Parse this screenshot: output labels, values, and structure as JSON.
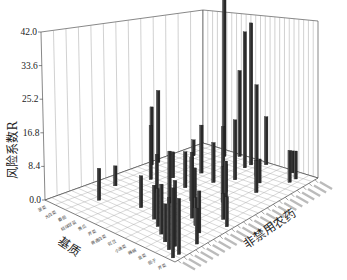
{
  "chart_data": {
    "type": "bar3d",
    "title": "",
    "ylabel": "风险系数R",
    "xlabel": "基质",
    "zlabel": "非禁用农药",
    "ylim": [
      0,
      42.0
    ],
    "y_ticks": [
      "0.0",
      "8.4",
      "16.8",
      "25.2",
      "33.6",
      "42.0"
    ],
    "grid": true,
    "matrix_categories": [
      "菠菜",
      "大白菜",
      "番茄",
      "结球甘蓝",
      "黄瓜",
      "芹菜",
      "普通白菜",
      "豇豆",
      "小油菜",
      "辣椒",
      "韭菜",
      "茄子",
      "芹菜"
    ],
    "pesticide_count": 24,
    "bars": [
      {
        "m": 0,
        "p": 16,
        "v": 18.0
      },
      {
        "m": 0,
        "p": 15,
        "v": 14.5
      },
      {
        "m": 1,
        "p": 20,
        "v": 4.0
      },
      {
        "m": 1,
        "p": 8,
        "v": 5.0
      },
      {
        "m": 2,
        "p": 12,
        "v": 13.5
      },
      {
        "m": 2,
        "p": 4,
        "v": 8.0
      },
      {
        "m": 3,
        "p": 14,
        "v": 6.5
      },
      {
        "m": 3,
        "p": 22,
        "v": 40.5
      },
      {
        "m": 4,
        "p": 10,
        "v": 9.5
      },
      {
        "m": 4,
        "p": 17,
        "v": 12.0
      },
      {
        "m": 4,
        "p": 23,
        "v": 21.5
      },
      {
        "m": 5,
        "p": 6,
        "v": 8.0
      },
      {
        "m": 5,
        "p": 13,
        "v": 9.0
      },
      {
        "m": 5,
        "p": 19,
        "v": 11.0
      },
      {
        "m": 6,
        "p": 9,
        "v": 13.0
      },
      {
        "m": 6,
        "p": 16,
        "v": 10.0
      },
      {
        "m": 6,
        "p": 21,
        "v": 34.0
      },
      {
        "m": 6,
        "p": 22,
        "v": 35.5
      },
      {
        "m": 7,
        "p": 5,
        "v": 8.5
      },
      {
        "m": 7,
        "p": 11,
        "v": 11.0
      },
      {
        "m": 7,
        "p": 18,
        "v": 15.0
      },
      {
        "m": 7,
        "p": 23,
        "v": 12.0
      },
      {
        "m": 8,
        "p": 4,
        "v": 9.5
      },
      {
        "m": 8,
        "p": 10,
        "v": 10.0
      },
      {
        "m": 8,
        "p": 15,
        "v": 7.0
      },
      {
        "m": 8,
        "p": 20,
        "v": 23.0
      },
      {
        "m": 9,
        "p": 3,
        "v": 12.5
      },
      {
        "m": 9,
        "p": 8,
        "v": 16.5
      },
      {
        "m": 9,
        "p": 13,
        "v": 9.0
      },
      {
        "m": 9,
        "p": 19,
        "v": 6.0
      },
      {
        "m": 10,
        "p": 2,
        "v": 9.5
      },
      {
        "m": 10,
        "p": 7,
        "v": 7.0
      },
      {
        "m": 10,
        "p": 12,
        "v": 12.0
      },
      {
        "m": 10,
        "p": 17,
        "v": 8.0
      },
      {
        "m": 10,
        "p": 23,
        "v": 5.5
      },
      {
        "m": 11,
        "p": 1,
        "v": 13.0
      },
      {
        "m": 11,
        "p": 2,
        "v": 16.5
      },
      {
        "m": 11,
        "p": 6,
        "v": 10.5
      },
      {
        "m": 11,
        "p": 10,
        "v": 6.5
      },
      {
        "m": 11,
        "p": 21,
        "v": 8.0
      },
      {
        "m": 11,
        "p": 22,
        "v": 7.0
      },
      {
        "m": 12,
        "p": 0,
        "v": 17.5
      },
      {
        "m": 12,
        "p": 1,
        "v": 14.0
      },
      {
        "m": 12,
        "p": 4,
        "v": 9.0
      },
      {
        "m": 12,
        "p": 9,
        "v": 7.5
      }
    ]
  }
}
